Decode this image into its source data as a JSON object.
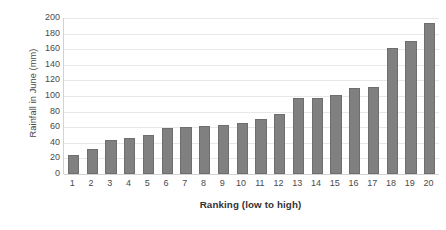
{
  "chart_data": {
    "type": "bar",
    "title": "",
    "xlabel": "Ranking (low to high)",
    "ylabel": "Rainfall in June  (mm)",
    "categories": [
      "1",
      "2",
      "3",
      "4",
      "5",
      "6",
      "7",
      "8",
      "9",
      "10",
      "11",
      "12",
      "13",
      "14",
      "15",
      "16",
      "17",
      "18",
      "19",
      "20"
    ],
    "values": [
      25,
      32,
      43,
      46,
      50,
      59,
      60,
      62,
      63,
      65,
      71,
      77,
      98,
      98,
      101,
      110,
      112,
      161,
      171,
      193
    ],
    "series": [
      {
        "name": "Rainfall in June (mm)",
        "values": [
          25,
          32,
          43,
          46,
          50,
          59,
          60,
          62,
          63,
          65,
          71,
          77,
          98,
          98,
          101,
          110,
          112,
          161,
          171,
          193
        ]
      }
    ],
    "ylim": [
      0,
      200
    ],
    "ytick_step": 20,
    "ytick_labels": [
      "200",
      "180",
      "160",
      "140",
      "120",
      "100",
      "80",
      "60",
      "40",
      "20",
      "0"
    ],
    "ytick_values": [
      200,
      180,
      160,
      140,
      120,
      100,
      80,
      60,
      40,
      20,
      0
    ],
    "grid": true,
    "grid_axis": "y",
    "legend": false,
    "legend_position": "none",
    "bar_color": "#808080",
    "bar_border_color": "#6e6e6e",
    "gridline_color": "#e8e8e8",
    "axis_color": "#d2d2d2",
    "text_color": "#4a4a4a",
    "background": "#ffffff"
  }
}
